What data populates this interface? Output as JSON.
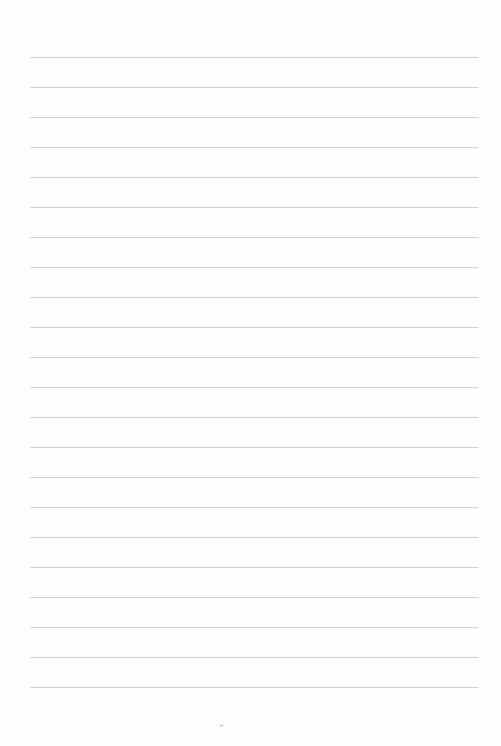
{
  "page": {
    "type": "blank lined paper",
    "line_count": 22,
    "first_line_y": 57,
    "line_spacing": 30,
    "line_left": 30,
    "line_width": 448,
    "line_color": "#d0d0d0",
    "background": "#fefefe"
  }
}
